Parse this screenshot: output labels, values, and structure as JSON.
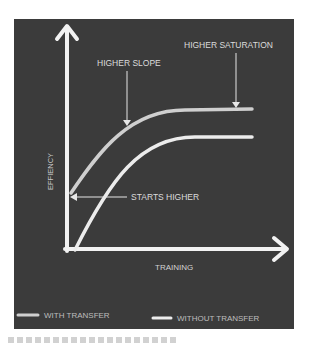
{
  "diagram": {
    "background": "#3b3b3b",
    "axes": {
      "y_label": "EFFIENCY",
      "x_label": "TRAINING",
      "color": "#f2f2f2"
    },
    "annotations": [
      {
        "id": "higher-slope",
        "text": "HIGHER SLOPE"
      },
      {
        "id": "higher-saturation",
        "text": "HIGHER SATURATION"
      },
      {
        "id": "starts-higher",
        "text": "STARTS HIGHER"
      }
    ],
    "legend": [
      {
        "label": "WITH TRANSFER",
        "color": "#cfcfcf"
      },
      {
        "label": "WITHOUT TRANSFER",
        "color": "#ececec"
      }
    ],
    "series": [
      {
        "name": "WITH TRANSFER",
        "color": "#cfcfcf",
        "description": "starts higher, steeper slope, higher saturation"
      },
      {
        "name": "WITHOUT TRANSFER",
        "color": "#ececec",
        "description": "starts at origin, lower saturation"
      }
    ]
  }
}
